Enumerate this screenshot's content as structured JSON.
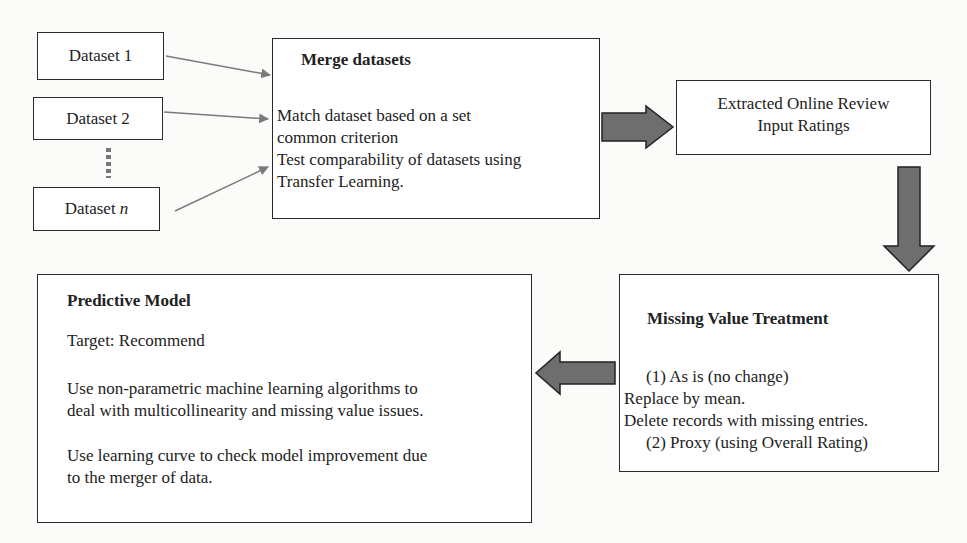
{
  "datasets": {
    "d1": {
      "prefix": "Dataset ",
      "suffix": "1"
    },
    "d2": {
      "prefix": "Dataset ",
      "suffix": "2"
    },
    "dn": {
      "prefix": "Dataset ",
      "suffix": "n"
    },
    "ellipsis": "vertical-dots"
  },
  "merge": {
    "title": "Merge datasets",
    "lines": [
      "Match dataset based on a set",
      "common criterion",
      "Test comparability of datasets using",
      "Transfer Learning."
    ]
  },
  "extracted": {
    "lines": [
      "Extracted Online Review",
      "Input Ratings"
    ]
  },
  "missing": {
    "title": "Missing Value Treatment",
    "lines": [
      "(1)  As is (no change)",
      "Replace by mean.",
      "Delete records with missing entries.",
      "(2)  Proxy (using Overall Rating)"
    ]
  },
  "predictive": {
    "title": "Predictive Model",
    "target": "Target: Recommend",
    "para1": [
      "Use non-parametric machine learning algorithms to",
      "deal with multicollinearity and missing value issues."
    ],
    "para2": [
      "Use learning curve to check model improvement due",
      "to the merger of data."
    ]
  },
  "colors": {
    "border": "#2a2a2a",
    "thin_arrow": "#7a7a7a",
    "block_arrow_fill": "#6e6e6e",
    "block_arrow_stroke": "#222222"
  }
}
